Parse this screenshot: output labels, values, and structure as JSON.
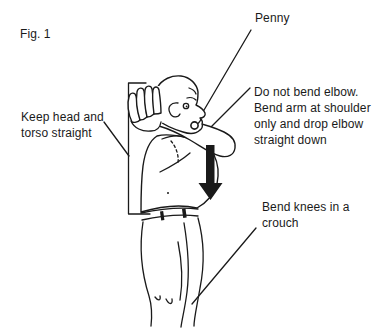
{
  "figure_label": "Fig. 1",
  "annotations": {
    "penny": {
      "text": "Penny"
    },
    "elbow_note": {
      "lines": [
        "Do not bend elbow.",
        "Bend arm at shoulder",
        "only and drop elbow",
        "straight down"
      ]
    },
    "posture_note": {
      "lines": [
        "Keep head and",
        "torso straight"
      ]
    },
    "knees_note": {
      "lines": [
        "Bend knees in a",
        "crouch"
      ]
    }
  },
  "illustration": {
    "icons": {
      "drop_arrow": "thick-down-arrow",
      "penny": "coin-circle"
    }
  },
  "colors": {
    "ink": "#1a1a1a",
    "arrow": "#111111",
    "background": "#ffffff"
  }
}
